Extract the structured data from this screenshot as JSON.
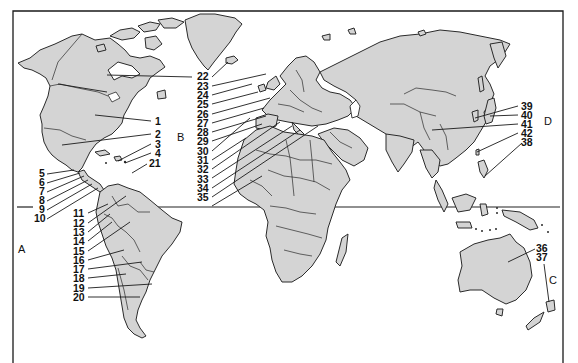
{
  "map": {
    "title": "",
    "type": "world outline map with numbered locations",
    "colors": {
      "land": "#d4d4d4",
      "ocean": "#ffffff",
      "outline": "#2a2a2a"
    },
    "region_labels": [
      {
        "id": "A",
        "label": "A",
        "x": 19,
        "y": 253
      },
      {
        "id": "B",
        "label": "B",
        "x": 178,
        "y": 141
      },
      {
        "id": "C",
        "label": "C",
        "x": 550,
        "y": 283
      },
      {
        "id": "D",
        "label": "D",
        "x": 545,
        "y": 124
      }
    ],
    "numbered_labels": [
      {
        "label": "1",
        "x": 155,
        "y": 125
      },
      {
        "label": "2",
        "x": 155,
        "y": 138
      },
      {
        "label": "3",
        "x": 155,
        "y": 148
      },
      {
        "label": "4",
        "x": 155,
        "y": 157
      },
      {
        "label": "21",
        "x": 150,
        "y": 166
      },
      {
        "label": "5",
        "x": 40,
        "y": 177
      },
      {
        "label": "6",
        "x": 40,
        "y": 186
      },
      {
        "label": "7",
        "x": 40,
        "y": 195
      },
      {
        "label": "8",
        "x": 40,
        "y": 204
      },
      {
        "label": "9",
        "x": 40,
        "y": 213
      },
      {
        "label": "10",
        "x": 35,
        "y": 222
      },
      {
        "label": "11",
        "x": 73,
        "y": 217
      },
      {
        "label": "12",
        "x": 73,
        "y": 227
      },
      {
        "label": "13",
        "x": 73,
        "y": 236
      },
      {
        "label": "14",
        "x": 73,
        "y": 245
      },
      {
        "label": "15",
        "x": 73,
        "y": 255
      },
      {
        "label": "16",
        "x": 73,
        "y": 264
      },
      {
        "label": "17",
        "x": 73,
        "y": 273
      },
      {
        "label": "18",
        "x": 73,
        "y": 282
      },
      {
        "label": "19",
        "x": 73,
        "y": 292
      },
      {
        "label": "20",
        "x": 73,
        "y": 301
      },
      {
        "label": "22",
        "x": 197,
        "y": 80
      },
      {
        "label": "23",
        "x": 197,
        "y": 90
      },
      {
        "label": "24",
        "x": 197,
        "y": 99
      },
      {
        "label": "25",
        "x": 197,
        "y": 108
      },
      {
        "label": "26",
        "x": 197,
        "y": 118
      },
      {
        "label": "27",
        "x": 197,
        "y": 127
      },
      {
        "label": "28",
        "x": 197,
        "y": 136
      },
      {
        "label": "29",
        "x": 197,
        "y": 145
      },
      {
        "label": "30",
        "x": 197,
        "y": 155
      },
      {
        "label": "31",
        "x": 197,
        "y": 164
      },
      {
        "label": "32",
        "x": 197,
        "y": 173
      },
      {
        "label": "33",
        "x": 197,
        "y": 183
      },
      {
        "label": "34",
        "x": 197,
        "y": 192
      },
      {
        "label": "35",
        "x": 197,
        "y": 201
      },
      {
        "label": "39",
        "x": 521,
        "y": 110
      },
      {
        "label": "40",
        "x": 521,
        "y": 119
      },
      {
        "label": "41",
        "x": 521,
        "y": 128
      },
      {
        "label": "42",
        "x": 521,
        "y": 137
      },
      {
        "label": "38",
        "x": 521,
        "y": 146
      },
      {
        "label": "36",
        "x": 537,
        "y": 252
      },
      {
        "label": "37",
        "x": 537,
        "y": 261
      }
    ]
  }
}
